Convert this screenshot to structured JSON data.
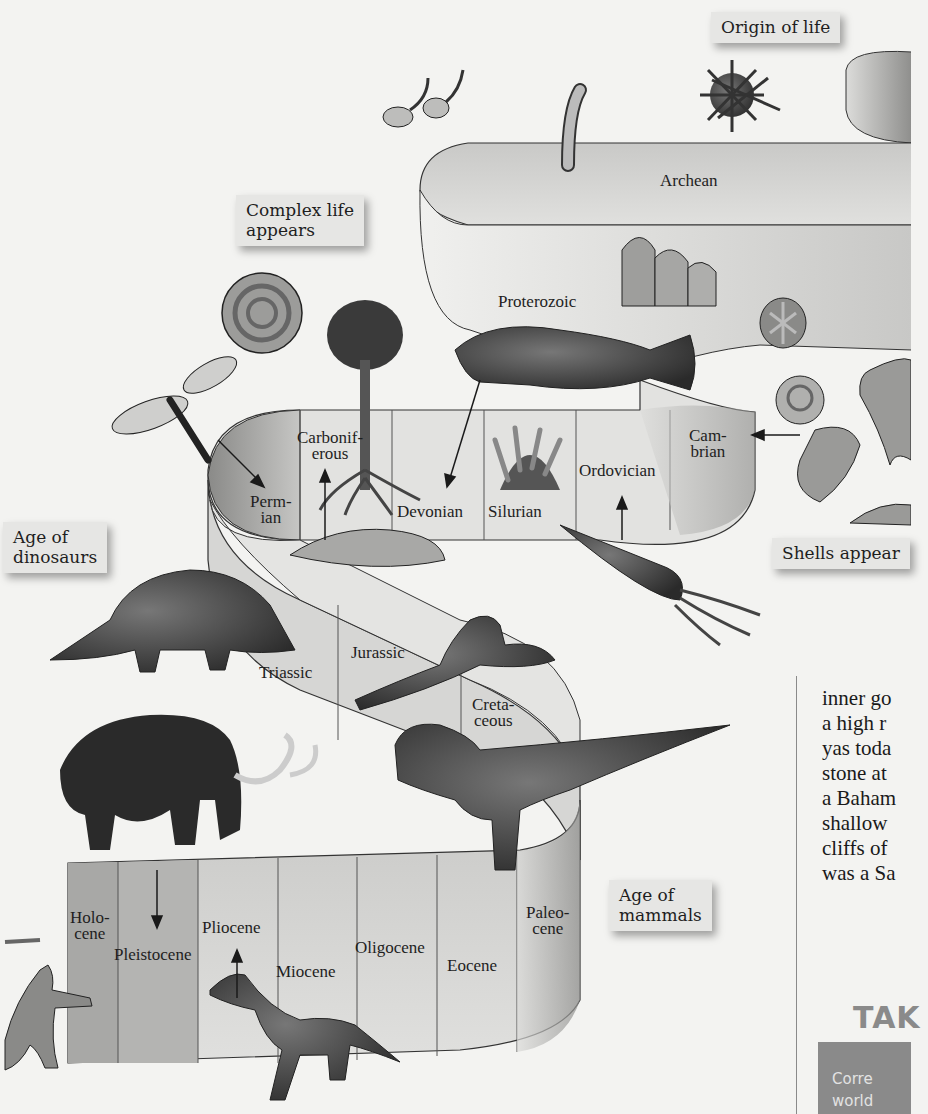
{
  "diagram": {
    "type": "geologic-time-ribbon",
    "eons_eras": [
      {
        "name": "Archean",
        "label": "Archean"
      },
      {
        "name": "Proterozoic",
        "label": "Proterozoic"
      }
    ],
    "periods": {
      "paleozoic": [
        {
          "name": "Cambrian",
          "label": "Cam-\nbrian"
        },
        {
          "name": "Ordovician",
          "label": "Ordovician"
        },
        {
          "name": "Silurian",
          "label": "Silurian"
        },
        {
          "name": "Devonian",
          "label": "Devonian"
        },
        {
          "name": "Carboniferous",
          "label": "Carbonif-\nerous"
        },
        {
          "name": "Permian",
          "label": "Perm-\nian"
        }
      ],
      "mesozoic": [
        {
          "name": "Triassic",
          "label": "Triassic"
        },
        {
          "name": "Jurassic",
          "label": "Jurassic"
        },
        {
          "name": "Cretaceous",
          "label": "Creta-\nceous"
        }
      ],
      "cenozoic": [
        {
          "name": "Paleocene",
          "label": "Paleo-\ncene"
        },
        {
          "name": "Eocene",
          "label": "Eocene"
        },
        {
          "name": "Oligocene",
          "label": "Oligocene"
        },
        {
          "name": "Miocene",
          "label": "Miocene"
        },
        {
          "name": "Pliocene",
          "label": "Pliocene"
        },
        {
          "name": "Pleistocene",
          "label": "Pleistocene"
        },
        {
          "name": "Holocene",
          "label": "Holo-\ncene"
        }
      ]
    },
    "callouts": {
      "origin_of_life": "Origin of life",
      "complex_life": "Complex life\nappears",
      "shells_appear": "Shells appear",
      "age_of_dinosaurs": "Age of\ndinosaurs",
      "age_of_mammals": "Age of\nmammals"
    },
    "illustrations": [
      "flagellate-cells",
      "cyanobacteria-chain",
      "sea-urchin",
      "stromatolites",
      "ammonite",
      "armored-fish",
      "tree-fern",
      "sponge",
      "fossil-coin",
      "snail-shell",
      "trilobite",
      "scallop-shell",
      "dragonfly",
      "brachiopod",
      "nautiloid",
      "stegosaurus",
      "archaeopteryx",
      "tyrannosaurus",
      "woolly-mammoth",
      "horse",
      "human"
    ]
  },
  "article": {
    "lines": [
      "inner go",
      "a high r",
      "yas toda",
      "stone at",
      "a Baham",
      "shallow",
      "cliffs of",
      "was a Sa"
    ],
    "section_heading": "TAK",
    "box_lines": [
      "Corre",
      "world"
    ]
  },
  "colors": {
    "background": "#f3f3f1",
    "ribbon_light": "#dcdcda",
    "ribbon_dark": "#8e8e8c",
    "callout_bg": "#e6e6e4",
    "takeaway_box": "#8a8a8a"
  }
}
